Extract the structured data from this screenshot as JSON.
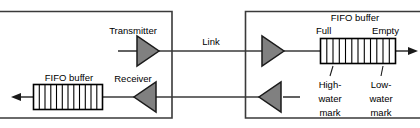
{
  "figure": {
    "type": "block-diagram",
    "colors": {
      "background": "#ffffff",
      "frame_stroke": "#3a3a3a",
      "wire_stroke": "#3a3a3a",
      "amplifier_fill": "#808080",
      "amplifier_stroke": "#1a1a1a",
      "buffer_fill": "#ffffff",
      "buffer_stroke": "#000000",
      "text": "#000000"
    }
  },
  "left_node": {
    "name": "left-device",
    "frame": {
      "x": 13,
      "y": 11,
      "width": 159,
      "height": 107,
      "open_side": "left"
    },
    "transmitter": {
      "label": "Transmitter",
      "label_x": 133,
      "label_y": 31,
      "direction": "right"
    },
    "receiver": {
      "label": "Receiver",
      "label_x": 133,
      "label_y": 79,
      "direction": "left"
    },
    "fifo_buffer": {
      "label": "FIFO buffer",
      "label_x": 70,
      "label_y": 79,
      "cells": 11
    }
  },
  "link": {
    "label": "Link",
    "label_x": 211,
    "label_y": 42
  },
  "right_node": {
    "name": "right-device",
    "frame": {
      "x": 245,
      "y": 11,
      "width": 175,
      "height": 107,
      "open_side": "right"
    },
    "fifo_buffer": {
      "label": "FIFO buffer",
      "label_x": 355,
      "label_y": 18,
      "left_end_label": "Full",
      "right_end_label": "Empty",
      "cells": 11
    },
    "marks": [
      {
        "id": "high-water-mark",
        "lines": [
          "High-",
          "water",
          "mark"
        ],
        "x": 330,
        "y_start": 85
      },
      {
        "id": "low-water-mark",
        "lines": [
          "Low-",
          "water",
          "mark"
        ],
        "x": 381,
        "y_start": 85
      }
    ]
  }
}
